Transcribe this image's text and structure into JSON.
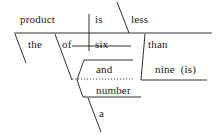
{
  "diagram": {
    "type": "reed-kellogg-sentence-diagram",
    "sentence": "The product of six and a number is less than nine (is).",
    "ink_color": "#1a1a1a",
    "background_color": "#ffffff",
    "words": [
      {
        "id": "product",
        "text": "product",
        "x": 20,
        "y": 14,
        "role": "subject"
      },
      {
        "id": "is",
        "text": "is",
        "x": 95,
        "y": 14,
        "role": "verb"
      },
      {
        "id": "less",
        "text": "less",
        "x": 131,
        "y": 14,
        "role": "predicate-adjective"
      },
      {
        "id": "the",
        "text": "the",
        "x": 28,
        "y": 39,
        "role": "article-modifier"
      },
      {
        "id": "of",
        "text": "of",
        "x": 62,
        "y": 39,
        "role": "preposition"
      },
      {
        "id": "six",
        "text": "six",
        "x": 95,
        "y": 39,
        "role": "object-of-preposition"
      },
      {
        "id": "than",
        "text": "than",
        "x": 148,
        "y": 39,
        "role": "preposition"
      },
      {
        "id": "and",
        "text": "and",
        "x": 96,
        "y": 64,
        "role": "conjunction"
      },
      {
        "id": "nine-is",
        "text": "nine  (is)",
        "x": 155,
        "y": 64,
        "role": "object-of-preposition"
      },
      {
        "id": "number",
        "text": "number",
        "x": 96,
        "y": 85,
        "role": "object-of-preposition"
      },
      {
        "id": "a",
        "text": "a",
        "x": 99,
        "y": 108,
        "role": "article-modifier"
      }
    ],
    "lines": [
      {
        "id": "main-baseline",
        "kind": "solid",
        "x1": 14,
        "y1": 33,
        "x2": 212,
        "y2": 33
      },
      {
        "id": "subject-verb-divider",
        "kind": "solid",
        "x1": 89,
        "y1": 14,
        "x2": 89,
        "y2": 51
      },
      {
        "id": "predicate-adjective-slant",
        "kind": "solid",
        "x1": 117,
        "y1": 2,
        "x2": 129,
        "y2": 33
      },
      {
        "id": "the-modifier-slant",
        "kind": "solid",
        "x1": 15,
        "y1": 34,
        "x2": 26,
        "y2": 63
      },
      {
        "id": "of-prep-slant",
        "kind": "solid",
        "x1": 55,
        "y1": 34,
        "x2": 72,
        "y2": 80
      },
      {
        "id": "six-object-line",
        "kind": "solid",
        "x1": 72,
        "y1": 46,
        "x2": 131,
        "y2": 46
      },
      {
        "id": "than-prep-slant",
        "kind": "solid",
        "x1": 145,
        "y1": 34,
        "x2": 141,
        "y2": 80
      },
      {
        "id": "nine-object-line",
        "kind": "solid",
        "x1": 141,
        "y1": 80,
        "x2": 207,
        "y2": 80
      },
      {
        "id": "conj-upper-slant",
        "kind": "solid",
        "x1": 84,
        "y1": 60,
        "x2": 77,
        "y2": 80
      },
      {
        "id": "conj-lower-slant",
        "kind": "solid",
        "x1": 77,
        "y1": 80,
        "x2": 83,
        "y2": 97
      },
      {
        "id": "and-branch-line",
        "kind": "solid",
        "x1": 84,
        "y1": 60,
        "x2": 133,
        "y2": 60
      },
      {
        "id": "conjunction-dotted-line",
        "kind": "dotted",
        "x1": 72,
        "y1": 79,
        "x2": 133,
        "y2": 79
      },
      {
        "id": "number-branch-line",
        "kind": "solid",
        "x1": 83,
        "y1": 97,
        "x2": 141,
        "y2": 97
      },
      {
        "id": "a-modifier-slant",
        "kind": "solid",
        "x1": 88,
        "y1": 98,
        "x2": 101,
        "y2": 132
      }
    ]
  }
}
